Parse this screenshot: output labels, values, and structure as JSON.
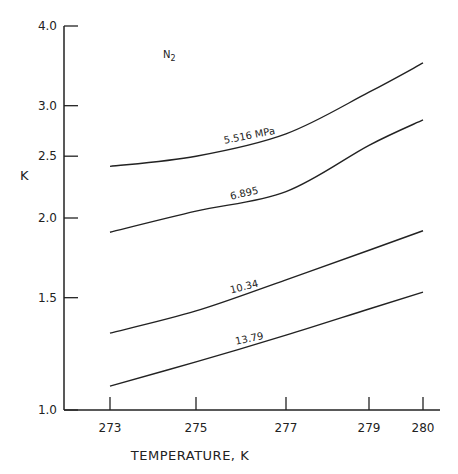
{
  "chart_data": {
    "type": "line",
    "title": "",
    "annotation": "N2",
    "xlabel": "TEMPERATURE, K",
    "ylabel": "K",
    "xlim": [
      272.2,
      280.4
    ],
    "ylim": [
      1.0,
      4.0
    ],
    "yscale": "log",
    "xticks": [
      273,
      275,
      277,
      279,
      280
    ],
    "yticks": [
      1.0,
      1.5,
      2.0,
      2.5,
      3.0,
      4.0
    ],
    "ytick_labels": [
      "1.0",
      "1.5",
      "2.0",
      "2.5",
      "3.0",
      "4.0"
    ],
    "grid": false,
    "legend": "inline labels",
    "series": [
      {
        "name": "5.516 MPa",
        "label": "5.516 MPa",
        "x": [
          273,
          275,
          277,
          279,
          280
        ],
        "values": [
          2.41,
          2.5,
          2.71,
          3.15,
          3.5
        ]
      },
      {
        "name": "6.895 MPa",
        "label": "6.895",
        "x": [
          273,
          275,
          277,
          279,
          280
        ],
        "values": [
          1.9,
          2.05,
          2.2,
          2.6,
          2.85
        ]
      },
      {
        "name": "10.34 MPa",
        "label": "10.34",
        "x": [
          273,
          275,
          277,
          279,
          280
        ],
        "values": [
          1.32,
          1.43,
          1.6,
          1.78,
          1.91
        ]
      },
      {
        "name": "13.79 MPa",
        "label": "13.79",
        "x": [
          273,
          275,
          277,
          279,
          280
        ],
        "values": [
          1.09,
          1.19,
          1.31,
          1.44,
          1.53
        ]
      }
    ]
  }
}
